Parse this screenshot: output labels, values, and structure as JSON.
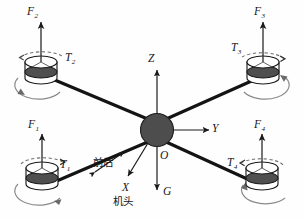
{
  "figure": {
    "background_color": "#fefefe",
    "stroke_color": "#1a1a1a",
    "hub_fill": "#4a4a4a",
    "rotor_top_fill": "#ffffff",
    "rotor_disc_fill": "#4f4f4f",
    "spin_arc_color": "#7d7d7d"
  },
  "axes": {
    "z_label": "Z",
    "y_label": "Y",
    "x_label": "X",
    "g_label": "G",
    "origin_label": "O"
  },
  "annotations": {
    "fore_aft": "前后",
    "nose": "机头"
  },
  "rotors": [
    {
      "id": "rotor-1",
      "position": "bottom-left",
      "force_label": "F",
      "force_sub": "1",
      "torque_label": "T",
      "torque_sub": "1",
      "cx": 42,
      "cy": 173,
      "force_label_x": 28,
      "force_label_y": 122,
      "torque_label_x": 58,
      "torque_label_y": 162
    },
    {
      "id": "rotor-2",
      "position": "top-left",
      "force_label": "F",
      "force_sub": "2",
      "torque_label": "T",
      "torque_sub": "2",
      "cx": 41,
      "cy": 67,
      "force_label_x": 27,
      "force_label_y": 7,
      "torque_label_x": 63,
      "torque_label_y": 55
    },
    {
      "id": "rotor-3",
      "position": "top-right",
      "force_label": "F",
      "force_sub": "3",
      "torque_label": "T",
      "torque_sub": "3",
      "cx": 263,
      "cy": 67,
      "force_label_x": 255,
      "force_label_y": 7,
      "torque_label_x": 232,
      "torque_label_y": 45
    },
    {
      "id": "rotor-4",
      "position": "bottom-right",
      "force_label": "F",
      "force_sub": "4",
      "torque_label": "T",
      "torque_sub": "4",
      "cx": 262,
      "cy": 173,
      "force_label_x": 255,
      "force_label_y": 122,
      "torque_label_x": 229,
      "torque_label_y": 160
    }
  ],
  "hub": {
    "cx": 157,
    "cy": 130,
    "r": 16
  }
}
